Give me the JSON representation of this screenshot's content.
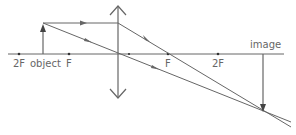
{
  "diagram": {
    "type": "converging-lens-ray-diagram",
    "labels": {
      "left_2f": "2F",
      "object": "object",
      "left_f": "F",
      "right_f": "F",
      "right_2f": "2F",
      "image": "image"
    },
    "colors": {
      "line": "#666666",
      "text": "#666666",
      "background": "#ffffff"
    }
  }
}
